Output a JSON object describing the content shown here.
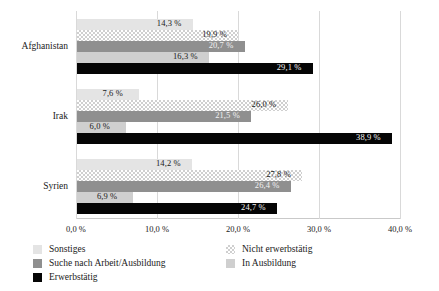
{
  "chart_data": {
    "type": "bar",
    "orientation": "horizontal",
    "title": "",
    "subtitle": "",
    "xlabel": "",
    "ylabel": "",
    "xlim": [
      0,
      40
    ],
    "grid": true,
    "legend_position": "bottom",
    "categories": [
      "Afghanistan",
      "Irak",
      "Syrien"
    ],
    "xtick_labels": [
      "0,0 %",
      "10,0 %",
      "20,0 %",
      "30,0 %",
      "40,0 %"
    ],
    "xtick_values": [
      0,
      10,
      20,
      30,
      40
    ],
    "series": [
      {
        "name": "Sonstiges",
        "key": "sonstiges",
        "color": "#e4e4e4",
        "values": [
          14.3,
          7.6,
          14.2
        ],
        "labels": [
          "14,3 %",
          "7,6 %",
          "14,2 %"
        ]
      },
      {
        "name": "Nicht erwerbstätig",
        "key": "nicht-erwerbstaetig",
        "color": "#cfcfcf",
        "values": [
          19.9,
          26.0,
          27.8
        ],
        "labels": [
          "19,9 %",
          "26,0 %",
          "27,8 %"
        ]
      },
      {
        "name": "Suche nach Arbeit/Ausbildung",
        "key": "suche-nach-arbeit-ausbildung",
        "color": "#8f8f8f",
        "values": [
          20.7,
          21.5,
          26.4
        ],
        "labels": [
          "20,7 %",
          "21,5 %",
          "26,4 %"
        ]
      },
      {
        "name": "In Ausbildung",
        "key": "in-ausbildung",
        "color": "#cfcfcf",
        "values": [
          16.3,
          6.0,
          6.9
        ],
        "labels": [
          "16,3 %",
          "6,0 %",
          "6,9 %"
        ]
      },
      {
        "name": "Erwerbstätig",
        "key": "erwerbstaetig",
        "color": "#050505",
        "values": [
          29.1,
          38.9,
          24.7
        ],
        "labels": [
          "29,1 %",
          "38,9 %",
          "24,7 %"
        ]
      }
    ]
  },
  "legend": {
    "left": [
      {
        "label": "Sonstiges",
        "key": "sonstiges"
      },
      {
        "label": "Suche nach Arbeit/Ausbildung",
        "key": "suche-nach-arbeit-ausbildung"
      },
      {
        "label": "Erwerbstätig",
        "key": "erwerbstaetig"
      }
    ],
    "right": [
      {
        "label": "Nicht erwerbstätig",
        "key": "nicht-erwerbstaetig"
      },
      {
        "label": "In Ausbildung",
        "key": "in-ausbildung"
      }
    ]
  }
}
